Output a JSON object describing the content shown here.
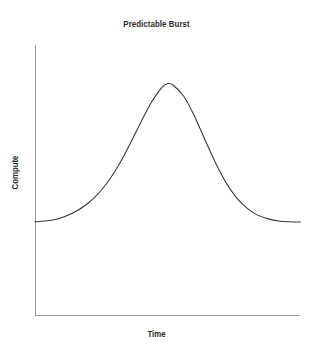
{
  "chart_data": {
    "type": "line",
    "title": "Predictable Burst",
    "xlabel": "Time",
    "ylabel": "Compute",
    "grid": false,
    "legend": null,
    "xticks": [],
    "yticks": [],
    "xtick_labels": [],
    "ytick_labels": [],
    "xlim": [
      0,
      1
    ],
    "ylim": [
      0,
      1
    ],
    "series": [
      {
        "name": "Compute",
        "color": "#333333",
        "x": [
          0.0,
          0.04,
          0.08,
          0.12,
          0.16,
          0.2,
          0.24,
          0.28,
          0.32,
          0.36,
          0.4,
          0.44,
          0.48,
          0.5,
          0.52,
          0.56,
          0.6,
          0.64,
          0.68,
          0.72,
          0.76,
          0.8,
          0.84,
          0.88,
          0.92,
          0.96,
          1.0
        ],
        "y": [
          0.345,
          0.348,
          0.355,
          0.368,
          0.387,
          0.414,
          0.451,
          0.5,
          0.562,
          0.636,
          0.715,
          0.789,
          0.844,
          0.857,
          0.852,
          0.812,
          0.74,
          0.652,
          0.566,
          0.492,
          0.435,
          0.396,
          0.37,
          0.356,
          0.348,
          0.345,
          0.344
        ]
      }
    ],
    "annotations": []
  },
  "axes": {
    "axis_color": "#9a9a9a",
    "axis_line_width": 1,
    "y_axis": {
      "x": 35,
      "y_top": 45,
      "y_bottom": 315
    },
    "x_axis": {
      "y": 315,
      "x_left": 35,
      "x_right": 300
    }
  },
  "colors": {
    "background": "#ffffff",
    "curve": "#333333",
    "axis": "#9a9a9a",
    "text": "#2b2b2b"
  }
}
